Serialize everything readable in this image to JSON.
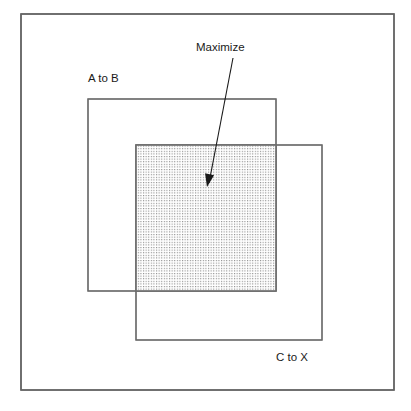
{
  "figure": {
    "background_color": "#ffffff",
    "frame": {
      "name": "outer-frame",
      "x": 21,
      "y": 14,
      "width": 373,
      "height": 376,
      "stroke_color": "#636363",
      "fill_color": "#ffffff"
    }
  },
  "regions": [
    {
      "id": "a-to-b",
      "label": "A to B",
      "x": 88,
      "y": 99,
      "width": 188,
      "height": 192,
      "stroke_color": "#6b6b6b",
      "fill": "none",
      "label_x": 88,
      "label_y": 82,
      "label_anchor": "start"
    },
    {
      "id": "c-to-x",
      "label": "C to X",
      "x": 136,
      "y": 145,
      "width": 186,
      "height": 195,
      "stroke_color": "#6b6b6b",
      "fill": "none",
      "label_x": 276,
      "label_y": 361,
      "label_anchor": "start"
    }
  ],
  "overlap": {
    "id": "maximize-overlap",
    "label": "Maximize",
    "x": 136,
    "y": 145,
    "width": 140,
    "height": 146,
    "stroke_color": "#6f6f6f",
    "fill_pattern": "dot-stipple",
    "dot_color": "#8a8a8a",
    "dot_pitch": 2.6,
    "label_x": 196,
    "label_y": 51,
    "label_anchor": "start"
  },
  "callout": {
    "name": "maximize-arrow",
    "start_x": 233,
    "start_y": 58,
    "end_x": 209,
    "end_y": 183,
    "tip_x": 207,
    "tip_y": 187,
    "color": "#1a1a1a"
  }
}
